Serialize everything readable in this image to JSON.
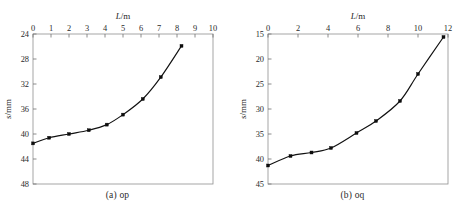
{
  "figure": {
    "panel_count": 2,
    "background": "#ffffff",
    "line_color": "#111111",
    "marker_color": "#0d0d0d",
    "axis_color": "#8f8f8f"
  },
  "panels": [
    {
      "caption": "(a) op",
      "chart_data": {
        "type": "line",
        "title": "",
        "xlabel": "L/m",
        "ylabel": "s/mm",
        "xlim": [
          0,
          10
        ],
        "ylim": [
          48,
          24
        ],
        "y_inverted": true,
        "xticks": [
          0,
          1,
          2,
          3,
          4,
          5,
          6,
          7,
          8,
          9,
          10
        ],
        "yticks": [
          24,
          28,
          32,
          36,
          40,
          44,
          48
        ],
        "xtick_labels": [
          "0",
          "1",
          "2",
          "3",
          "4",
          "5",
          "6",
          "7",
          "8",
          "9",
          "10"
        ],
        "ytick_labels": [
          "24",
          "28",
          "32",
          "36",
          "40",
          "44",
          "48"
        ],
        "grid": false,
        "legend": "none",
        "marker": "square",
        "x": [
          0,
          0.9,
          2.0,
          3.1,
          4.1,
          5.0,
          6.1,
          7.1,
          8.25
        ],
        "values": [
          41.5,
          40.6,
          40.0,
          39.4,
          38.5,
          36.9,
          34.4,
          30.9,
          25.9
        ]
      }
    },
    {
      "caption": "(b) oq",
      "chart_data": {
        "type": "line",
        "title": "",
        "xlabel": "L/m",
        "ylabel": "s/mm",
        "xlim": [
          0,
          12
        ],
        "ylim": [
          45,
          15
        ],
        "y_inverted": true,
        "xticks": [
          0,
          2,
          4,
          6,
          8,
          10,
          12
        ],
        "yticks": [
          15,
          20,
          25,
          30,
          35,
          40,
          45
        ],
        "xtick_labels": [
          "0",
          "2",
          "4",
          "6",
          "8",
          "10",
          "12"
        ],
        "ytick_labels": [
          "15",
          "20",
          "25",
          "30",
          "35",
          "40",
          "45"
        ],
        "grid": false,
        "legend": "none",
        "marker": "square",
        "x": [
          0,
          1.5,
          2.9,
          4.2,
          5.9,
          7.2,
          8.8,
          10.0,
          11.7
        ],
        "values": [
          41.3,
          39.4,
          38.7,
          37.8,
          34.8,
          32.4,
          28.4,
          23.0,
          15.6
        ]
      }
    }
  ],
  "axis_label_parts": {
    "x_italic": "L",
    "x_rest": "/m",
    "y_italic": "s",
    "y_rest": "/mm"
  }
}
